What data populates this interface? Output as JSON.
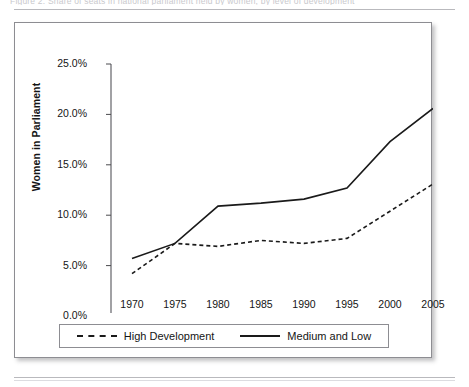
{
  "page": {
    "cut_caption": "Figure 2. Share of seats in national parliament held by women, by level of development",
    "background": "#ffffff",
    "frame_color": "#8d8d92"
  },
  "chart_data": {
    "type": "line",
    "title": "",
    "subtitle": "",
    "xlabel": "",
    "ylabel": "Women in Parliament",
    "x": [
      1970,
      1975,
      1980,
      1985,
      1990,
      1995,
      2000,
      2005
    ],
    "xtick_labels": [
      "1970",
      "1975",
      "1980",
      "1985",
      "1990",
      "1995",
      "2000",
      "2005"
    ],
    "ytick_labels": [
      "0.0%",
      "5.0%",
      "10.0%",
      "15.0%",
      "20.0%",
      "25.0%"
    ],
    "ytick_values": [
      0,
      5,
      10,
      15,
      20,
      25
    ],
    "ylim": [
      0,
      25
    ],
    "xlim": [
      1970,
      2005
    ],
    "y_unit": "%",
    "grid": false,
    "legend_position": "bottom",
    "series": [
      {
        "name": "High Development",
        "style": "dashed",
        "color": "#1a1a1a",
        "values": [
          5.7,
          7.2,
          10.9,
          11.2,
          11.6,
          12.7,
          17.3,
          20.6
        ]
      },
      {
        "name": "Medium and Low",
        "style": "solid",
        "color": "#1a1a1a",
        "values": [
          4.2,
          7.2,
          6.9,
          7.5,
          7.2,
          7.7,
          10.4,
          13.1
        ]
      }
    ]
  },
  "legend": {
    "items": [
      {
        "label": "High Development",
        "style": "dashed"
      },
      {
        "label": "Medium and Low",
        "style": "solid"
      }
    ]
  }
}
